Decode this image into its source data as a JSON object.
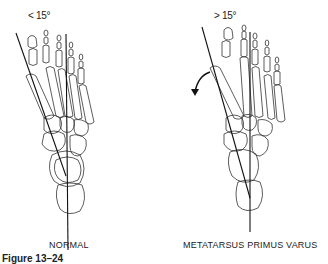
{
  "figure": {
    "panels": [
      {
        "id": "normal",
        "angle_label": "< 15°",
        "caption": "NORMAL"
      },
      {
        "id": "metatarsus-primus-varus",
        "angle_label": "> 15°",
        "caption": "METATARSUS PRIMUS VARUS"
      }
    ],
    "figure_label": "Figure 13–24"
  }
}
